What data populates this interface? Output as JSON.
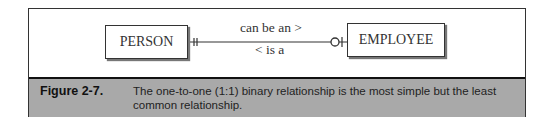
{
  "diagram": {
    "entities": [
      {
        "name": "PERSON"
      },
      {
        "name": "EMPLOYEE"
      }
    ],
    "relationship": {
      "forward_label": "can be an >",
      "reverse_label": "< is a",
      "left_cardinality": "one-and-only-one",
      "right_cardinality": "zero-or-one",
      "type": "one-to-one (1:1) binary"
    }
  },
  "caption": {
    "label": "Figure 2-7.",
    "text": "The one-to-one (1:1) binary relationship is the most simple but the least common relationship."
  },
  "colors": {
    "caption_bg": "#a9a9a9",
    "border": "#333333"
  }
}
